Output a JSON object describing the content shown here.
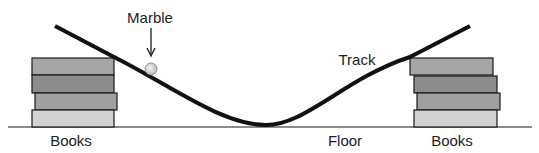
{
  "diagram": {
    "labels": {
      "marble": "Marble",
      "track": "Track",
      "floor": "Floor",
      "books_left": "Books",
      "books_right": "Books"
    },
    "colors": {
      "background": "#ffffff",
      "track": "#111111",
      "outline": "#1a1a1a",
      "book_1": "#a6a6a6",
      "book_2": "#8c8c8c",
      "book_3": "#a0a0a0",
      "book_4": "#d2d2d2",
      "marble": "#d9d9d9"
    },
    "books_left": [
      {
        "x": 32,
        "y": 58,
        "w": 82,
        "h": 17,
        "color": "#a6a6a6"
      },
      {
        "x": 32,
        "y": 75,
        "w": 82,
        "h": 18,
        "color": "#8c8c8c"
      },
      {
        "x": 35,
        "y": 93,
        "w": 82,
        "h": 17,
        "color": "#a0a0a0"
      },
      {
        "x": 32,
        "y": 110,
        "w": 82,
        "h": 17,
        "color": "#d2d2d2"
      }
    ],
    "books_right": [
      {
        "x": 410,
        "y": 58,
        "w": 83,
        "h": 17,
        "color": "#a6a6a6"
      },
      {
        "x": 414,
        "y": 76,
        "w": 83,
        "h": 17,
        "color": "#8c8c8c"
      },
      {
        "x": 417,
        "y": 93,
        "w": 83,
        "h": 17,
        "color": "#a0a0a0"
      },
      {
        "x": 414,
        "y": 110,
        "w": 83,
        "h": 17,
        "color": "#d2d2d2"
      }
    ]
  }
}
